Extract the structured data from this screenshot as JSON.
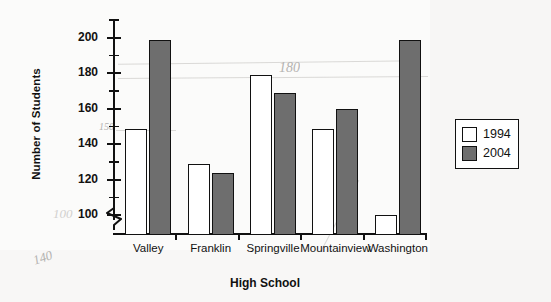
{
  "chart_data": {
    "type": "bar",
    "title": "",
    "xlabel": "High School",
    "ylabel": "Number of Students",
    "categories": [
      "Valley",
      "Franklin",
      "Springville",
      "Mountainview",
      "Washington"
    ],
    "series": [
      {
        "name": "1994",
        "color": "#ffffff",
        "values": [
          150,
          130,
          180,
          150,
          101
        ]
      },
      {
        "name": "2004",
        "color": "#6e6e6e",
        "values": [
          200,
          125,
          170,
          161,
          200
        ]
      }
    ],
    "ylim": [
      90,
      210
    ],
    "ytick_labels": [
      "100",
      "120",
      "140",
      "160",
      "180",
      "200"
    ],
    "ytick_values": [
      100,
      120,
      140,
      160,
      180,
      200
    ],
    "yminor_values": [
      90,
      110,
      130,
      150,
      170,
      190,
      210
    ],
    "axis_break": true,
    "grid": false,
    "legend_position": "right"
  },
  "legend": {
    "entries": [
      {
        "label": "1994"
      },
      {
        "label": "2004"
      }
    ]
  },
  "annotations": [
    {
      "text": "150",
      "note": "handwritten pencil note near 150 gridline"
    },
    {
      "text": "180",
      "note": "handwritten pencil note above Springville"
    },
    {
      "text": "100",
      "note": "handwritten pencil mark left of axis"
    },
    {
      "text": "140",
      "note": "handwritten pencil scribble bottom left"
    }
  ]
}
